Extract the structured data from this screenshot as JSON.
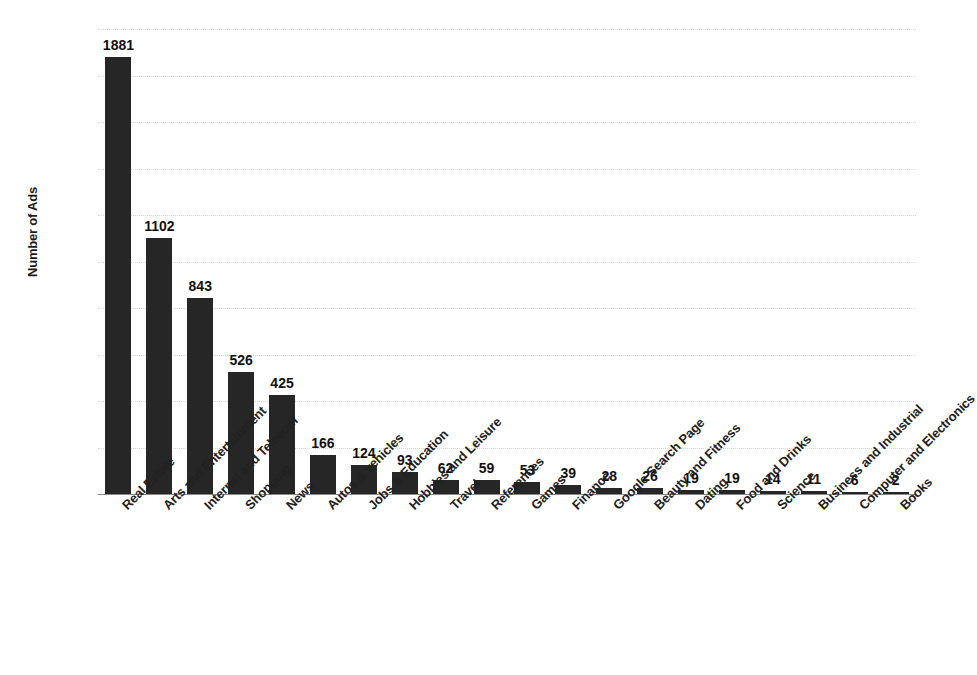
{
  "chart_data": {
    "type": "bar",
    "title": "",
    "xlabel": "",
    "ylabel": "Number of Ads",
    "ylim": [
      0,
      2000
    ],
    "y_ticks": [
      0,
      200,
      400,
      600,
      800,
      1000,
      1200,
      1400,
      1600,
      1800,
      2000
    ],
    "grid": true,
    "legend": "none",
    "bar_color": "#262626",
    "categories": [
      "Real Estate",
      "Arts and Entertainment",
      "Internet and Telecom",
      "Shopping",
      "News",
      "Autos & vehicles",
      "Jobs & Education",
      "Hobbies and Leisure",
      "Travel",
      "References",
      "Games",
      "Finance",
      "Google Search Page",
      "Beauty and Fitness",
      "Dating",
      "Food and Drinks",
      "Science",
      "Business and Industrial",
      "Computer and Electronics",
      "Books"
    ],
    "values": [
      1881,
      1102,
      843,
      526,
      425,
      166,
      124,
      93,
      62,
      59,
      53,
      39,
      28,
      26,
      19,
      19,
      14,
      11,
      6,
      2
    ]
  }
}
